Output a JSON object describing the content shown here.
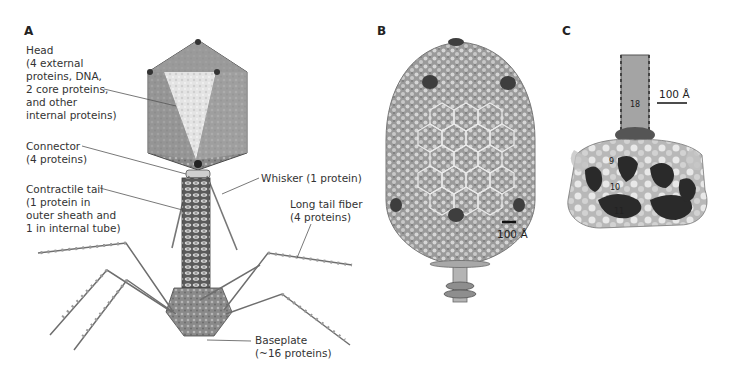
{
  "figure": {
    "panels": [
      {
        "letter": "A",
        "description": "Schematic of T4 bacteriophage"
      },
      {
        "letter": "B",
        "description": "Capsid reconstruction"
      },
      {
        "letter": "C",
        "description": "Tail and baseplate reconstruction"
      }
    ],
    "panel_a": {
      "letter": "A",
      "labels": {
        "head": "Head\n(4 external\nproteins, DNA,\n2 core proteins,\nand other\ninternal proteins)",
        "connector": "Connector\n(4 proteins)",
        "contractile_tail": "Contractile tail\n(1 protein in\nouter sheath and\n1 in internal tube)",
        "whisker": "Whisker (1 protein)",
        "long_tail_fiber": "Long tail fiber\n(4 proteins)",
        "baseplate": "Baseplate\n(~16 proteins)"
      }
    },
    "panel_b": {
      "letter": "B",
      "scale_bar": "100 Å"
    },
    "panel_c": {
      "letter": "C",
      "scale_bar": "100 Å",
      "protein_numbers": [
        "18",
        "9",
        "10",
        "11"
      ]
    }
  }
}
